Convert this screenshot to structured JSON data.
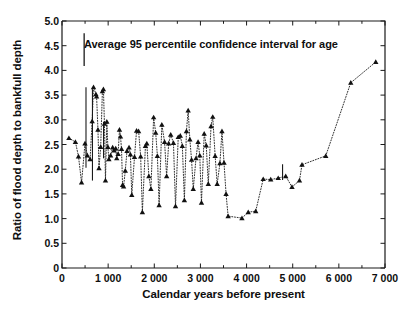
{
  "chart_data": {
    "type": "line",
    "title": "",
    "subtitle": "",
    "xlabel": "Calendar years before present",
    "ylabel": "Ratio of flood depth to bankfull depth",
    "xlim": [
      0,
      7000
    ],
    "ylim": [
      0,
      5.0
    ],
    "x_major_ticks": [
      0,
      1000,
      2000,
      3000,
      4000,
      5000,
      6000,
      7000
    ],
    "x_minor_ticks": [
      500,
      1500,
      2500,
      3500,
      4500,
      5500,
      6500
    ],
    "y_major_ticks": [
      0,
      0.5,
      1.0,
      1.5,
      2.0,
      2.5,
      3.0,
      3.5,
      4.0,
      4.5,
      5.0
    ],
    "x_tick_labels": [
      "0",
      "1 000",
      "2 000",
      "3 000",
      "4 000",
      "5 000",
      "6 000",
      "7 000"
    ],
    "y_tick_labels": [
      "0",
      "0.5",
      "1.0",
      "1.5",
      "2.0",
      "2.5",
      "3.0",
      "3.5",
      "4.0",
      "4.5",
      "5.0"
    ],
    "grid": false,
    "legend": false,
    "marker": "filled-triangle",
    "line_style": "dotted",
    "line_color": "#1a1a1a",
    "marker_color": "#111111",
    "series": [
      {
        "name": "Ratio of flood depth to bankfull depth",
        "points": [
          [
            160,
            2.63
          ],
          [
            255,
            2.55
          ],
          [
            300,
            2.26
          ],
          [
            345,
            1.73
          ],
          [
            395,
            2.52
          ],
          [
            430,
            2.28
          ],
          [
            470,
            2.2
          ],
          [
            500,
            2.97
          ],
          [
            520,
            3.66
          ],
          [
            555,
            3.52
          ],
          [
            565,
            3.47
          ],
          [
            585,
            2.8
          ],
          [
            600,
            2.02
          ],
          [
            625,
            2.45
          ],
          [
            650,
            3.58
          ],
          [
            665,
            3.62
          ],
          [
            680,
            2.92
          ],
          [
            695,
            1.77
          ],
          [
            715,
            2.96
          ],
          [
            730,
            2.45
          ],
          [
            745,
            2.2
          ],
          [
            770,
            2.28
          ],
          [
            800,
            2.44
          ],
          [
            820,
            2.38
          ],
          [
            845,
            2.42
          ],
          [
            860,
            2.22
          ],
          [
            880,
            2.31
          ],
          [
            900,
            2.8
          ],
          [
            915,
            2.66
          ],
          [
            930,
            2.41
          ],
          [
            945,
            1.68
          ],
          [
            960,
            1.65
          ],
          [
            985,
            1.97
          ],
          [
            1010,
            2.37
          ],
          [
            1040,
            2.44
          ],
          [
            1060,
            2.3
          ],
          [
            1080,
            1.48
          ],
          [
            1120,
            2.25
          ],
          [
            1150,
            2.78
          ],
          [
            1180,
            2.77
          ],
          [
            1210,
            2.26
          ],
          [
            1235,
            1.13
          ],
          [
            1280,
            2.47
          ],
          [
            1300,
            2.52
          ],
          [
            1330,
            1.86
          ],
          [
            1360,
            1.6
          ],
          [
            1400,
            3.05
          ],
          [
            1430,
            2.74
          ],
          [
            1455,
            2.27
          ],
          [
            1480,
            1.27
          ],
          [
            1520,
            2.9
          ],
          [
            1560,
            2.55
          ],
          [
            1590,
            1.86
          ],
          [
            1620,
            2.52
          ],
          [
            1650,
            2.7
          ],
          [
            1690,
            2.53
          ],
          [
            1720,
            1.25
          ],
          [
            1760,
            2.65
          ],
          [
            1790,
            2.68
          ],
          [
            1820,
            2.47
          ],
          [
            1850,
            1.37
          ],
          [
            1880,
            2.77
          ],
          [
            1905,
            3.19
          ],
          [
            1930,
            2.6
          ],
          [
            1955,
            2.19
          ],
          [
            1980,
            1.6
          ],
          [
            2020,
            2.22
          ],
          [
            2050,
            2.55
          ],
          [
            2075,
            2.28
          ],
          [
            2100,
            1.32
          ],
          [
            2140,
            2.72
          ],
          [
            2170,
            2.48
          ],
          [
            2200,
            1.7
          ],
          [
            2240,
            2.87
          ],
          [
            2265,
            3.06
          ],
          [
            2300,
            2.27
          ],
          [
            2330,
            1.7
          ],
          [
            2370,
            2.12
          ],
          [
            2400,
            2.77
          ],
          [
            2430,
            2.13
          ],
          [
            2460,
            1.5
          ],
          [
            2490,
            1.05
          ],
          [
            2530,
            1.01
          ],
          [
            2580,
            1.13
          ],
          [
            2640,
            1.15
          ],
          [
            2700,
            1.8
          ],
          [
            2760,
            1.79
          ],
          [
            2820,
            1.82
          ],
          [
            2880,
            1.86
          ],
          [
            2930,
            1.64
          ],
          [
            2990,
            1.77
          ],
          [
            3010,
            2.09
          ],
          [
            3200,
            2.27
          ],
          [
            3400,
            3.75
          ],
          [
            3600,
            4.17
          ]
        ],
        "note": "x values listed above are sequence indices mapped to calendar-year positions in render"
      }
    ],
    "annotations": [
      {
        "text": "Average 95 percentile confidence interval for age",
        "marker": "vertical-confidence-bar",
        "x_years": 480,
        "y_center": 4.42,
        "y_half_height": 0.33
      }
    ],
    "error_bars": [
      {
        "x_years": 520,
        "y_low": 2.03,
        "y_high": 3.66
      },
      {
        "x_years": 660,
        "y_low": 1.77,
        "y_high": 3.62
      },
      {
        "x_years": 900,
        "y_low": 2.22,
        "y_high": 2.96
      },
      {
        "x_years": 4780,
        "y_low": 1.78,
        "y_high": 2.1
      }
    ]
  }
}
